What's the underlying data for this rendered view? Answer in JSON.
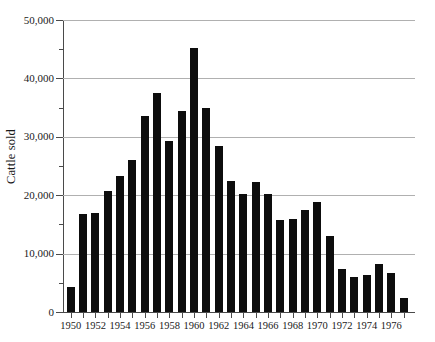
{
  "chart_data": {
    "type": "bar",
    "title": "",
    "subtitle": "",
    "xlabel": "",
    "ylabel": "Cattle sold",
    "ylim": [
      0,
      50000
    ],
    "xlim": [
      1949.5,
      1977.5
    ],
    "grid": true,
    "legend": null,
    "y_ticks_major": [
      0,
      10000,
      20000,
      30000,
      40000,
      50000
    ],
    "y_ticks_major_labels": [
      "0",
      "10,000",
      "20,000",
      "30,000",
      "40,000",
      "50,000"
    ],
    "y_ticks_minor": [
      5000,
      15000,
      25000,
      35000,
      45000
    ],
    "x_tick_labels": [
      "1950",
      "1952",
      "1954",
      "1956",
      "1958",
      "1960",
      "1962",
      "1964",
      "1966",
      "1968",
      "1970",
      "1972",
      "1974",
      "1976"
    ],
    "categories": [
      "1950",
      "1951",
      "1952",
      "1953",
      "1954",
      "1955",
      "1956",
      "1957",
      "1958",
      "1959",
      "1960",
      "1961",
      "1962",
      "1963",
      "1964",
      "1965",
      "1966",
      "1967",
      "1968",
      "1969",
      "1970",
      "1971",
      "1972",
      "1973",
      "1974",
      "1975",
      "1976",
      "1977"
    ],
    "values": [
      4200,
      16800,
      17000,
      20800,
      23300,
      26100,
      33500,
      37500,
      29300,
      34400,
      45200,
      34900,
      28500,
      22400,
      20200,
      22300,
      20200,
      15700,
      16000,
      17500,
      18800,
      13000,
      7400,
      6000,
      6400,
      8300,
      6700,
      2400
    ],
    "bar_color": "#0d0d0d",
    "grid_color": "#b0b0b0",
    "axis_color": "#4a4a4a"
  }
}
